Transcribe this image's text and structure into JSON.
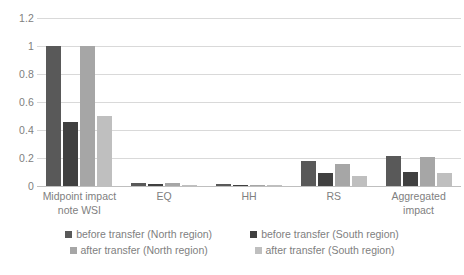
{
  "chart_data": {
    "type": "bar",
    "title": "",
    "subtitle": "",
    "xlabel": "",
    "ylabel": "",
    "ylim": [
      0,
      1.2
    ],
    "yticks": [
      0,
      0.2,
      0.4,
      0.6,
      0.8,
      1,
      1.2
    ],
    "ytick_labels": [
      "0",
      "0.2",
      "0.4",
      "0.6",
      "0.8",
      "1",
      "1.2"
    ],
    "grid": true,
    "legend_position": "bottom",
    "categories": [
      "Midpoint impact note WSI",
      "EQ",
      "HH",
      "RS",
      "Aggregated impact"
    ],
    "category_lines": [
      [
        "Midpoint impact",
        "note WSI"
      ],
      [
        "EQ"
      ],
      [
        "HH"
      ],
      [
        "RS"
      ],
      [
        "Aggregated",
        "impact"
      ]
    ],
    "series": [
      {
        "name": "before transfer (North region)",
        "color": "#595959",
        "values": [
          1.0,
          0.02,
          0.012,
          0.18,
          0.215
        ]
      },
      {
        "name": "before transfer (South region)",
        "color": "#404040",
        "values": [
          0.46,
          0.013,
          0.008,
          0.09,
          0.1
        ]
      },
      {
        "name": "after transfer (North region)",
        "color": "#a6a6a6",
        "values": [
          1.0,
          0.018,
          0.01,
          0.16,
          0.205
        ]
      },
      {
        "name": "after transfer (South region)",
        "color": "#bfbfbf",
        "values": [
          0.5,
          0.009,
          0.005,
          0.075,
          0.095
        ]
      }
    ]
  },
  "legend": {
    "items": [
      "before transfer (North region)",
      "before transfer (South region)",
      "after transfer (North region)",
      "after transfer (South region)"
    ]
  }
}
